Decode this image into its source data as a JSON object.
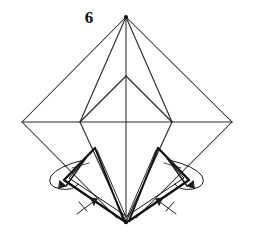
{
  "figure": {
    "step_number": "6",
    "type": "origami-instruction-diagram",
    "canvas": {
      "width": 253,
      "height": 239
    },
    "colors": {
      "background": "#ffffff",
      "thin_line": "#2b2b2b",
      "heavy_line": "#111111",
      "arrow": "#1a1a1a",
      "label": "#0d0d0d"
    },
    "geometry": {
      "apex_top": {
        "x": 126,
        "y": 17
      },
      "bottom_point": {
        "x": 126,
        "y": 222
      },
      "outer_left": {
        "x": 22,
        "y": 122
      },
      "outer_right": {
        "x": 232,
        "y": 122
      },
      "inner_left": {
        "x": 80,
        "y": 122
      },
      "inner_right": {
        "x": 172,
        "y": 122
      },
      "inner_apex": {
        "x": 126,
        "y": 76
      },
      "left_flap_top": {
        "x": 95,
        "y": 148
      },
      "right_flap_top": {
        "x": 158,
        "y": 148
      }
    },
    "annotations": {
      "left_turn_arrow": {
        "x": 68,
        "y": 178,
        "kind": "fold-loop-arrow"
      },
      "right_turn_arrow": {
        "x": 185,
        "y": 178,
        "kind": "fold-loop-arrow"
      },
      "left_tick_arrow": {
        "x": 88,
        "y": 208,
        "kind": "fold-tick-arrow"
      },
      "right_tick_arrow": {
        "x": 165,
        "y": 208,
        "kind": "fold-tick-arrow"
      }
    }
  }
}
